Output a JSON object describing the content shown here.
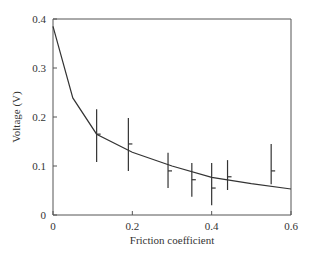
{
  "chart_data": {
    "type": "line",
    "title": "",
    "xlabel": "Friction coefficient",
    "ylabel": "Voltage (V)",
    "xlim": [
      0,
      0.6
    ],
    "ylim": [
      0,
      0.4
    ],
    "grid": false,
    "legend": null,
    "x_ticks": [
      "0",
      "0.2",
      "0.4",
      "0.6"
    ],
    "x_tick_values": [
      0,
      0.2,
      0.4,
      0.6
    ],
    "y_ticks": [
      "0",
      "0.1",
      "0.2",
      "0.3",
      "0.4"
    ],
    "y_tick_values": [
      0,
      0.1,
      0.2,
      0.3,
      0.4
    ],
    "series": [
      {
        "name": "model curve",
        "kind": "line",
        "x": [
          0,
          0.05,
          0.11,
          0.2,
          0.3,
          0.4,
          0.5,
          0.6
        ],
        "y": [
          0.385,
          0.239,
          0.165,
          0.128,
          0.1,
          0.077,
          0.064,
          0.053
        ]
      },
      {
        "name": "measurements",
        "kind": "errorbar",
        "x": [
          0.11,
          0.19,
          0.29,
          0.35,
          0.4,
          0.44,
          0.55
        ],
        "y": [
          0.165,
          0.145,
          0.09,
          0.072,
          0.055,
          0.078,
          0.09
        ],
        "y_low": [
          0.108,
          0.09,
          0.055,
          0.037,
          0.02,
          0.051,
          0.063
        ],
        "y_high": [
          0.216,
          0.198,
          0.127,
          0.106,
          0.106,
          0.112,
          0.145
        ]
      }
    ]
  }
}
